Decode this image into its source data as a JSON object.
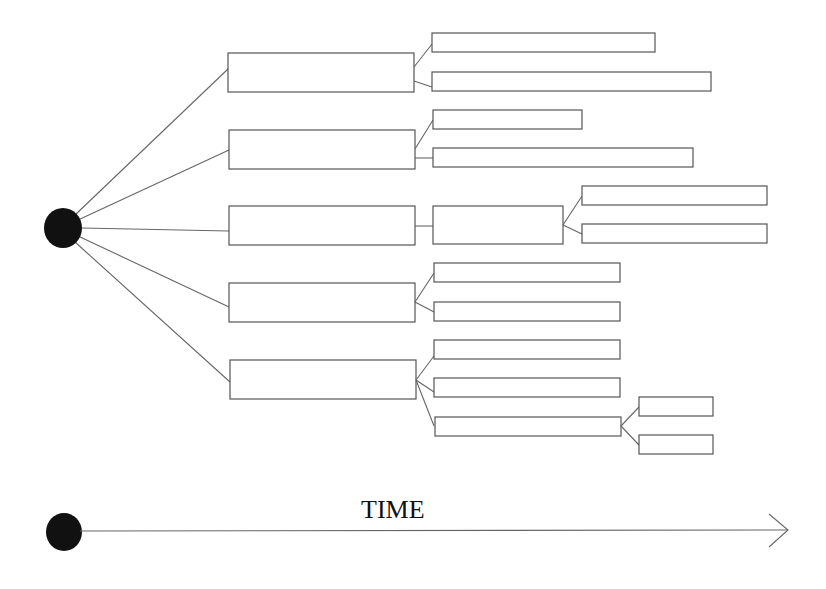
{
  "diagram": {
    "type": "branching-tree",
    "root": "origin-dot",
    "levels": {
      "level1_boxes": 5,
      "level2_boxes": 12,
      "level3_boxes": 4
    },
    "boxes_have_text": false
  },
  "timeline": {
    "label": "TIME",
    "direction": "left-to-right"
  },
  "colors": {
    "background": "#ffffff",
    "line": "#666666",
    "node": "#111111"
  }
}
